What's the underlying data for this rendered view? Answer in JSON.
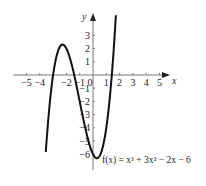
{
  "chart_data": {
    "type": "line",
    "title": "",
    "function_label": "f(x) = x³ + 3x² − 2x − 6",
    "xlabel": "x",
    "ylabel": "y",
    "xlim": [
      -5.5,
      5.9
    ],
    "ylim": [
      -6.8,
      4.6
    ],
    "x_ticks": [
      -5,
      -4,
      -2,
      -1,
      0,
      1,
      2,
      3,
      4,
      5
    ],
    "x_tick_labels": [
      "−5",
      "−4",
      "−2",
      "−1",
      "0",
      "1",
      "2",
      "3",
      "4",
      "5"
    ],
    "y_ticks": [
      3,
      2,
      1,
      -1,
      -2,
      -3,
      -4,
      -5,
      -6
    ],
    "y_tick_labels": [
      "3",
      "2",
      "1",
      "−1",
      "−2",
      "−3",
      "−4",
      "−5",
      "−6"
    ],
    "grid": false,
    "series": [
      {
        "name": "f(x) = x^3 + 3x^2 - 2x - 6",
        "x_range": [
          -3.55,
          1.72
        ],
        "points": [
          [
            -3.5,
            -5.13
          ],
          [
            -3.0,
            0.0
          ],
          [
            -2.5,
            2.13
          ],
          [
            -2.29,
            2.27
          ],
          [
            -2.0,
            2.0
          ],
          [
            -1.5,
            0.38
          ],
          [
            -1.0,
            -2.0
          ],
          [
            -0.5,
            -4.38
          ],
          [
            0.0,
            -6.0
          ],
          [
            0.29,
            -6.27
          ],
          [
            0.5,
            -6.13
          ],
          [
            1.0,
            -4.0
          ],
          [
            1.41,
            0.0
          ],
          [
            1.5,
            0.38
          ],
          [
            1.72,
            4.5
          ]
        ],
        "color": "#111111"
      }
    ]
  }
}
